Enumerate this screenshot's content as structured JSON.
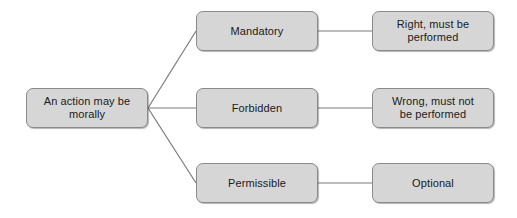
{
  "diagram": {
    "type": "tree",
    "orientation": "left-to-right",
    "background_color": "#ffffff",
    "node_fill_color": "#d6d6d6",
    "node_border_color": "#8a8a8a",
    "connector_color": "#7a7a7a",
    "text_color": "#1a1a1a",
    "root": {
      "id": "root",
      "label": "An action may be\nmorally"
    },
    "branches": [
      {
        "id": "mandatory",
        "label": "Mandatory",
        "consequence": {
          "id": "right-performed",
          "label": "Right, must be\nperformed"
        }
      },
      {
        "id": "forbidden",
        "label": "Forbidden",
        "consequence": {
          "id": "wrong-performed",
          "label": "Wrong, must not\nbe performed"
        }
      },
      {
        "id": "permissible",
        "label": "Permissible",
        "consequence": {
          "id": "optional",
          "label": "Optional"
        }
      }
    ]
  }
}
